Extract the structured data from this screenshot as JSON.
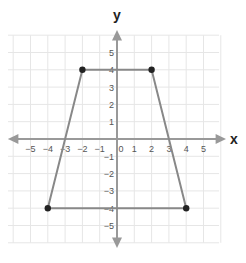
{
  "chart_data": {
    "type": "line",
    "title": "",
    "xlabel": "x",
    "ylabel": "y",
    "xlim": [
      -5,
      5
    ],
    "ylim": [
      -5,
      5
    ],
    "grid": true,
    "x_ticks": [
      "-5",
      "-4",
      "-3",
      "-2",
      "-1",
      "0",
      "1",
      "2",
      "3",
      "4",
      "5"
    ],
    "y_ticks": [
      "5",
      "4",
      "3",
      "2",
      "1",
      "-1",
      "-2",
      "-3",
      "-4",
      "-5"
    ],
    "series": [
      {
        "name": "trapezoid",
        "closed": true,
        "points": [
          [
            -2,
            4
          ],
          [
            2,
            4
          ],
          [
            4,
            -4
          ],
          [
            -4,
            -4
          ]
        ]
      }
    ],
    "colors": {
      "shape": "#888888",
      "points": "#222222",
      "axes": "#999999",
      "grid": "#e6e6e6"
    }
  }
}
